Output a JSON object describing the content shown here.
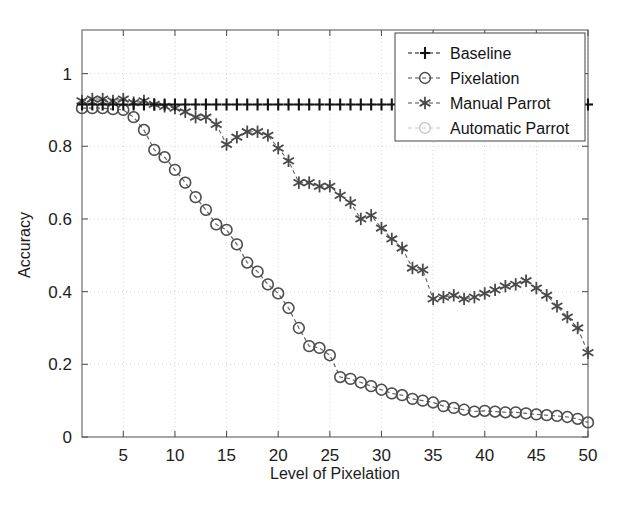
{
  "chart_data": {
    "type": "line",
    "title": "",
    "xlabel": "Level of Pixelation",
    "ylabel": "Accuracy",
    "xlim": [
      1,
      50
    ],
    "ylim": [
      0,
      1.12
    ],
    "xticks": [
      5,
      10,
      15,
      20,
      25,
      30,
      35,
      40,
      45,
      50
    ],
    "yticks": [
      0,
      0.2,
      0.4,
      0.6,
      0.8,
      1
    ],
    "xticklabels": [
      "5",
      "10",
      "15",
      "20",
      "25",
      "30",
      "35",
      "40",
      "45",
      "50"
    ],
    "yticklabels": [
      "0",
      "0.2",
      "0.4",
      "0.6",
      "0.8",
      "1"
    ],
    "grid": true,
    "legend_position": "top-right",
    "x": [
      1,
      2,
      3,
      4,
      5,
      6,
      7,
      8,
      9,
      10,
      11,
      12,
      13,
      14,
      15,
      16,
      17,
      18,
      19,
      20,
      21,
      22,
      23,
      24,
      25,
      26,
      27,
      28,
      29,
      30,
      31,
      32,
      33,
      34,
      35,
      36,
      37,
      38,
      39,
      40,
      41,
      42,
      43,
      44,
      45,
      46,
      47,
      48,
      49,
      50
    ],
    "series": [
      {
        "name": "Baseline",
        "marker": "plus",
        "color": "#141414",
        "linestyle": "dashed",
        "values": [
          0.915,
          0.915,
          0.915,
          0.915,
          0.915,
          0.915,
          0.915,
          0.915,
          0.915,
          0.915,
          0.915,
          0.915,
          0.915,
          0.915,
          0.915,
          0.915,
          0.915,
          0.915,
          0.915,
          0.915,
          0.915,
          0.915,
          0.915,
          0.915,
          0.915,
          0.915,
          0.915,
          0.915,
          0.915,
          0.915,
          0.915,
          0.915,
          0.915,
          0.915,
          0.915,
          0.915,
          0.915,
          0.915,
          0.915,
          0.915,
          0.915,
          0.915,
          0.915,
          0.915,
          0.915,
          0.915,
          0.915,
          0.915,
          0.915,
          0.915
        ]
      },
      {
        "name": "Pixelation",
        "marker": "circle",
        "color": "#4d4d4d",
        "linestyle": "dashed",
        "values": [
          0.905,
          0.905,
          0.905,
          0.902,
          0.9,
          0.88,
          0.845,
          0.79,
          0.77,
          0.735,
          0.7,
          0.66,
          0.625,
          0.585,
          0.57,
          0.53,
          0.48,
          0.455,
          0.42,
          0.395,
          0.355,
          0.3,
          0.25,
          0.245,
          0.225,
          0.165,
          0.16,
          0.15,
          0.14,
          0.13,
          0.12,
          0.115,
          0.105,
          0.1,
          0.095,
          0.085,
          0.08,
          0.075,
          0.07,
          0.072,
          0.07,
          0.068,
          0.068,
          0.065,
          0.062,
          0.06,
          0.058,
          0.055,
          0.05,
          0.04
        ]
      },
      {
        "name": "Manual Parrot",
        "marker": "asterisk",
        "color": "#4a4a4a",
        "linestyle": "dashed",
        "values": [
          0.925,
          0.93,
          0.93,
          0.925,
          0.93,
          0.92,
          0.925,
          0.915,
          0.91,
          0.905,
          0.895,
          0.88,
          0.88,
          0.86,
          0.805,
          0.825,
          0.84,
          0.84,
          0.83,
          0.795,
          0.76,
          0.7,
          0.7,
          0.69,
          0.69,
          0.665,
          0.645,
          0.6,
          0.61,
          0.575,
          0.545,
          0.52,
          0.465,
          0.46,
          0.38,
          0.385,
          0.39,
          0.38,
          0.385,
          0.395,
          0.405,
          0.415,
          0.42,
          0.43,
          0.41,
          0.39,
          0.36,
          0.33,
          0.3,
          0.232
        ]
      },
      {
        "name": "Automatic Parrot",
        "marker": "circle",
        "color": "#c9c9c9",
        "linestyle": "dashed",
        "values": [
          0.905,
          0.905,
          0.905,
          0.902,
          0.9,
          0.88,
          0.845,
          0.79,
          0.77,
          0.735,
          0.7,
          0.66,
          0.625,
          0.585,
          0.57,
          0.53,
          0.48,
          0.455,
          0.42,
          0.395,
          0.355,
          0.3,
          0.25,
          0.245,
          0.225,
          0.165,
          0.16,
          0.15,
          0.14,
          0.13,
          0.12,
          0.115,
          0.105,
          0.1,
          0.095,
          0.085,
          0.08,
          0.075,
          0.07,
          0.072,
          0.07,
          0.068,
          0.068,
          0.065,
          0.062,
          0.06,
          0.058,
          0.055,
          0.05,
          0.04
        ]
      }
    ]
  },
  "legend": {
    "entries": [
      {
        "label": "Baseline"
      },
      {
        "label": "Pixelation"
      },
      {
        "label": "Manual Parrot"
      },
      {
        "label": "Automatic Parrot"
      }
    ]
  },
  "axes": {
    "xlabel": "Level of Pixelation",
    "ylabel": "Accuracy"
  }
}
